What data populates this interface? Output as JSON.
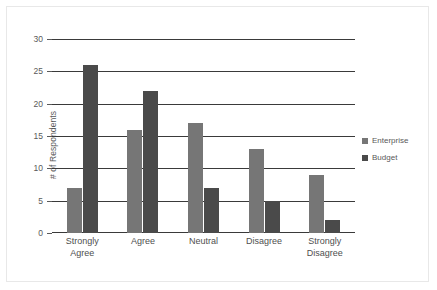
{
  "chart_data": {
    "type": "bar",
    "title": "",
    "xlabel": "",
    "ylabel": "# of Respondents",
    "ylim": [
      0,
      30
    ],
    "ytick_step": 5,
    "yticks": [
      0,
      5,
      10,
      15,
      20,
      25,
      30
    ],
    "ytick_labels": [
      "0",
      "5",
      "10",
      "15",
      "20",
      "25",
      "30"
    ],
    "grid": true,
    "legend_position": "right",
    "categories": [
      "Strongly Agree",
      "Agree",
      "Neutral",
      "Disagree",
      "Strongly Disagree"
    ],
    "category_lines": [
      [
        "Strongly",
        "Agree"
      ],
      [
        "Agree"
      ],
      [
        "Neutral"
      ],
      [
        "Disagree"
      ],
      [
        "Strongly",
        "Disagree"
      ]
    ],
    "series": [
      {
        "name": "Enterprise",
        "color": "#767676",
        "values": [
          7,
          16,
          17,
          13,
          9
        ]
      },
      {
        "name": "Budget",
        "color": "#4a4a4a",
        "values": [
          26,
          22,
          7,
          5,
          2
        ]
      }
    ]
  },
  "colors": {
    "gridline": "#3a3a3a",
    "axis_text": "#595959",
    "frame": "#e8e8e8",
    "background": "#ffffff"
  }
}
